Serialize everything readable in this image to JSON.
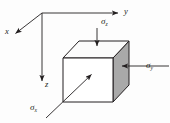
{
  "figure": {
    "background_color": "#fdfdfd",
    "line_color": "#231f20",
    "axes": {
      "origin": {
        "x": 42,
        "y": 13
      },
      "items": [
        {
          "name": "x-axis",
          "label": "x",
          "direction": "down-left",
          "from": {
            "x": 42,
            "y": 13
          },
          "to": {
            "x": 13,
            "y": 36
          },
          "arrowhead": true
        },
        {
          "name": "y-axis",
          "label": "y",
          "direction": "right",
          "from": {
            "x": 42,
            "y": 13
          },
          "to": {
            "x": 121,
            "y": 13
          },
          "arrowhead": true
        },
        {
          "name": "z-axis",
          "label": "z",
          "direction": "down",
          "from": {
            "x": 42,
            "y": 13
          },
          "to": {
            "x": 42,
            "y": 84
          },
          "arrowhead": true
        }
      ]
    },
    "cube": {
      "front_face_color": "#ffffff",
      "top_face_color": "#fbfbfb",
      "right_face_color": "#a9a9a9",
      "edge_color": "#231f20",
      "front_face": [
        {
          "x": 63,
          "y": 58
        },
        {
          "x": 113,
          "y": 58
        },
        {
          "x": 113,
          "y": 102
        },
        {
          "x": 63,
          "y": 102
        }
      ],
      "top_face": [
        {
          "x": 63,
          "y": 58
        },
        {
          "x": 79,
          "y": 41
        },
        {
          "x": 129,
          "y": 41
        },
        {
          "x": 113,
          "y": 58
        }
      ],
      "right_face": [
        {
          "x": 113,
          "y": 58
        },
        {
          "x": 129,
          "y": 41
        },
        {
          "x": 129,
          "y": 85
        },
        {
          "x": 113,
          "y": 102
        }
      ]
    },
    "stresses": [
      {
        "name": "sigma-z",
        "symbol": "σ",
        "subscript": "z",
        "acts_on": "top-face",
        "arrow_from": {
          "x": 97,
          "y": 29
        },
        "arrow_to": {
          "x": 97,
          "y": 48
        },
        "direction": "down",
        "label_position": {
          "x": 101,
          "y": 17
        }
      },
      {
        "name": "sigma-y",
        "symbol": "σ",
        "subscript": "y",
        "acts_on": "right-face",
        "arrow_from": {
          "x": 168,
          "y": 66
        },
        "arrow_to": {
          "x": 124,
          "y": 66
        },
        "direction": "left",
        "label_position": {
          "x": 146,
          "y": 61
        }
      },
      {
        "name": "sigma-x",
        "symbol": "σ",
        "subscript": "x",
        "acts_on": "front-face",
        "arrow_from": {
          "x": 47,
          "y": 117
        },
        "arrow_to": {
          "x": 90,
          "y": 76
        },
        "direction": "up-right",
        "label_position": {
          "x": 30,
          "y": 103
        }
      }
    ],
    "labels": {
      "axis_x": "x",
      "axis_y": "y",
      "axis_z": "z",
      "sigma": "σ",
      "sub_x": "x",
      "sub_y": "y",
      "sub_z": "z"
    }
  }
}
